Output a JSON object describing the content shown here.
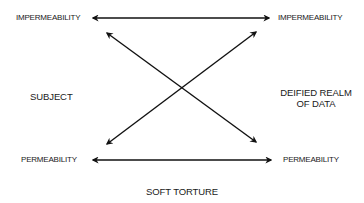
{
  "diagram": {
    "labels": {
      "top_left": "IMPERMEABILITY",
      "top_right": "IMPERMEABILITY",
      "middle_left": "SUBJECT",
      "middle_right_line1": "DEIFIED REALM",
      "middle_right_line2": "OF DATA",
      "bottom_left": "PERMEABILITY",
      "bottom_right": "PERMEABILITY",
      "bottom_center": "SOFT TORTURE"
    },
    "arrows": [
      {
        "name": "top-horizontal",
        "from": [
          93,
          18
        ],
        "to": [
          269,
          18
        ],
        "heads": "both"
      },
      {
        "name": "bottom-horizontal",
        "from": [
          93,
          160
        ],
        "to": [
          271,
          160
        ],
        "heads": "both"
      },
      {
        "name": "diagonal-down",
        "from": [
          107,
          33
        ],
        "to": [
          256,
          142
        ],
        "heads": "both"
      },
      {
        "name": "diagonal-up",
        "from": [
          107,
          144
        ],
        "to": [
          256,
          32
        ],
        "heads": "both"
      }
    ],
    "colors": {
      "line": "#111111",
      "text": "#1a1a1a",
      "background": "#ffffff"
    }
  }
}
